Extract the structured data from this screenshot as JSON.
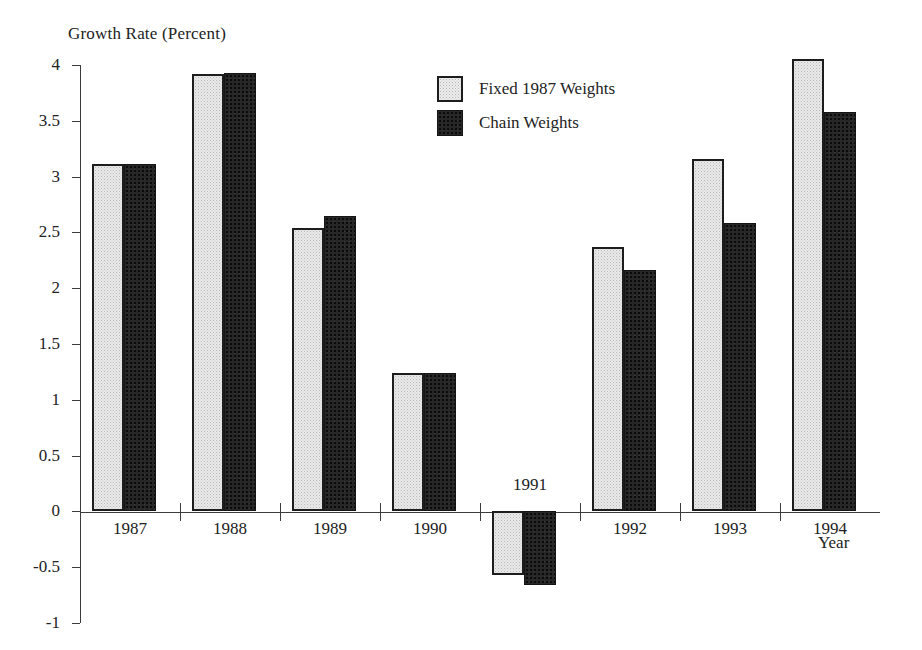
{
  "chart_data": {
    "type": "bar",
    "title": "Growth Rate (Percent)",
    "xlabel": "Year",
    "ylabel": "Growth Rate (Percent)",
    "categories": [
      "1987",
      "1988",
      "1989",
      "1990",
      "1991",
      "1992",
      "1993",
      "1994"
    ],
    "series": [
      {
        "name": "Fixed 1987 Weights",
        "values": [
          3.11,
          3.92,
          2.54,
          1.24,
          -0.57,
          2.37,
          3.16,
          4.05
        ]
      },
      {
        "name": "Chain Weights",
        "values": [
          3.11,
          3.93,
          2.65,
          1.24,
          -0.66,
          2.16,
          2.58,
          3.58
        ]
      }
    ],
    "ylim": [
      -1,
      4
    ],
    "ytick_labels": [
      "4",
      "3.5",
      "3",
      "2.5",
      "2",
      "1.5",
      "1",
      "0.5",
      "0",
      "-0.5",
      "-1"
    ],
    "ytick_values": [
      4,
      3.5,
      3,
      2.5,
      2,
      1.5,
      1,
      0.5,
      0,
      -0.5,
      -1
    ],
    "grid": false,
    "legend_position": "upper-center",
    "colors": {
      "fixed_weights": "#e9e9e9",
      "chain_weights": "#272727",
      "axis": "#3b3b3b",
      "text": "#222222",
      "background": "#ffffff"
    }
  },
  "legend": {
    "items": [
      {
        "label": "Fixed 1987 Weights",
        "swatch": "light"
      },
      {
        "label": "Chain Weights",
        "swatch": "dark"
      }
    ]
  }
}
